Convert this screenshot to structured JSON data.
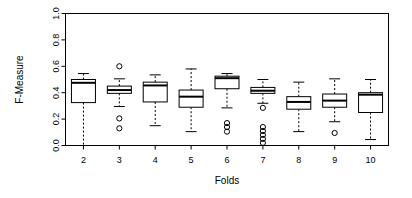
{
  "chart_data": {
    "type": "box",
    "title": "",
    "subtitle": "",
    "xlabel": "Folds",
    "ylabel": "F-Measure",
    "xlim": [
      1.5,
      10.5
    ],
    "ylim": [
      0.0,
      1.0
    ],
    "grid": false,
    "legend": null,
    "categories": [
      "2",
      "3",
      "4",
      "5",
      "6",
      "7",
      "8",
      "9",
      "10"
    ],
    "ytick_labels": [
      "0.0",
      "0.2",
      "0.4",
      "0.6",
      "0.8",
      "1.0"
    ],
    "ytick_values": [
      0.0,
      0.2,
      0.4,
      0.6,
      0.8,
      1.0
    ],
    "xtick_labels": [
      "2",
      "3",
      "4",
      "5",
      "6",
      "7",
      "8",
      "9",
      "10"
    ],
    "boxes": [
      {
        "category": "2",
        "whisker_low": 0.0,
        "q1": 0.325,
        "median": 0.475,
        "q3": 0.5,
        "whisker_high": 0.545,
        "outliers": []
      },
      {
        "category": "3",
        "whisker_low": 0.295,
        "q1": 0.395,
        "median": 0.42,
        "q3": 0.45,
        "whisker_high": 0.505,
        "outliers": [
          0.6,
          0.205,
          0.13
        ]
      },
      {
        "category": "4",
        "whisker_low": 0.15,
        "q1": 0.33,
        "median": 0.455,
        "q3": 0.48,
        "whisker_high": 0.535,
        "outliers": []
      },
      {
        "category": "5",
        "whisker_low": 0.105,
        "q1": 0.29,
        "median": 0.37,
        "q3": 0.42,
        "whisker_high": 0.58,
        "outliers": []
      },
      {
        "category": "6",
        "whisker_low": 0.285,
        "q1": 0.43,
        "median": 0.51,
        "q3": 0.525,
        "whisker_high": 0.545,
        "outliers": [
          0.17,
          0.14,
          0.105
        ]
      },
      {
        "category": "7",
        "whisker_low": 0.32,
        "q1": 0.395,
        "median": 0.415,
        "q3": 0.44,
        "whisker_high": 0.5,
        "outliers": [
          0.285,
          0.14,
          0.11,
          0.08,
          0.05,
          0.02
        ]
      },
      {
        "category": "8",
        "whisker_low": 0.105,
        "q1": 0.275,
        "median": 0.33,
        "q3": 0.37,
        "whisker_high": 0.48,
        "outliers": []
      },
      {
        "category": "9",
        "whisker_low": 0.18,
        "q1": 0.29,
        "median": 0.34,
        "q3": 0.39,
        "whisker_high": 0.505,
        "outliers": [
          0.095
        ]
      },
      {
        "category": "10",
        "whisker_low": 0.045,
        "q1": 0.25,
        "median": 0.385,
        "q3": 0.4,
        "whisker_high": 0.5,
        "outliers": []
      }
    ],
    "style": {
      "line_color": "#000000",
      "box_fill": "#ffffff",
      "background": "#ffffff",
      "whisker_dash": "2,2",
      "median_width": 2
    }
  }
}
